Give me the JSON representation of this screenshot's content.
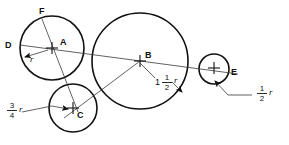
{
  "diagram": {
    "background_color": "#ffffff",
    "stroke_color": "#111111",
    "thin_stroke_color": "#3a3a3a",
    "point_labels": {
      "a": "A",
      "b": "B",
      "c": "C",
      "d": "D",
      "e": "E",
      "f": "F"
    },
    "dimension_labels": {
      "radius_a": {
        "whole": "",
        "numerator": "",
        "denominator": "",
        "variable": "r",
        "text": "r"
      },
      "radius_b": {
        "whole": "1",
        "numerator": "1",
        "denominator": "2",
        "variable": "r",
        "text": "1 1/2 r"
      },
      "radius_c": {
        "whole": "",
        "numerator": "3",
        "denominator": "4",
        "variable": "r",
        "text": "3/4 r"
      },
      "radius_e": {
        "whole": "",
        "numerator": "1",
        "denominator": "2",
        "variable": "r",
        "text": "1/2 r"
      }
    },
    "circles": [
      {
        "name": "circle-a",
        "center_label": "A",
        "cx": 52,
        "cy": 48,
        "r": 32,
        "radius_text": "r"
      },
      {
        "name": "circle-b",
        "center_label": "B",
        "cx": 140,
        "cy": 61,
        "r": 48,
        "radius_text": "1 1/2 r"
      },
      {
        "name": "circle-c",
        "center_label": "C",
        "cx": 73,
        "cy": 108,
        "r": 24,
        "radius_text": "3/4 r"
      },
      {
        "name": "circle-e",
        "center_label": "",
        "cx": 214,
        "cy": 69,
        "r": 15,
        "radius_text": "1/2 r"
      }
    ],
    "points": [
      {
        "name": "point-d",
        "label": "D",
        "x": 20,
        "y": 45
      },
      {
        "name": "point-f",
        "label": "F",
        "x": 42,
        "y": 19
      },
      {
        "name": "point-e",
        "label": "E",
        "x": 228,
        "y": 72
      }
    ]
  }
}
